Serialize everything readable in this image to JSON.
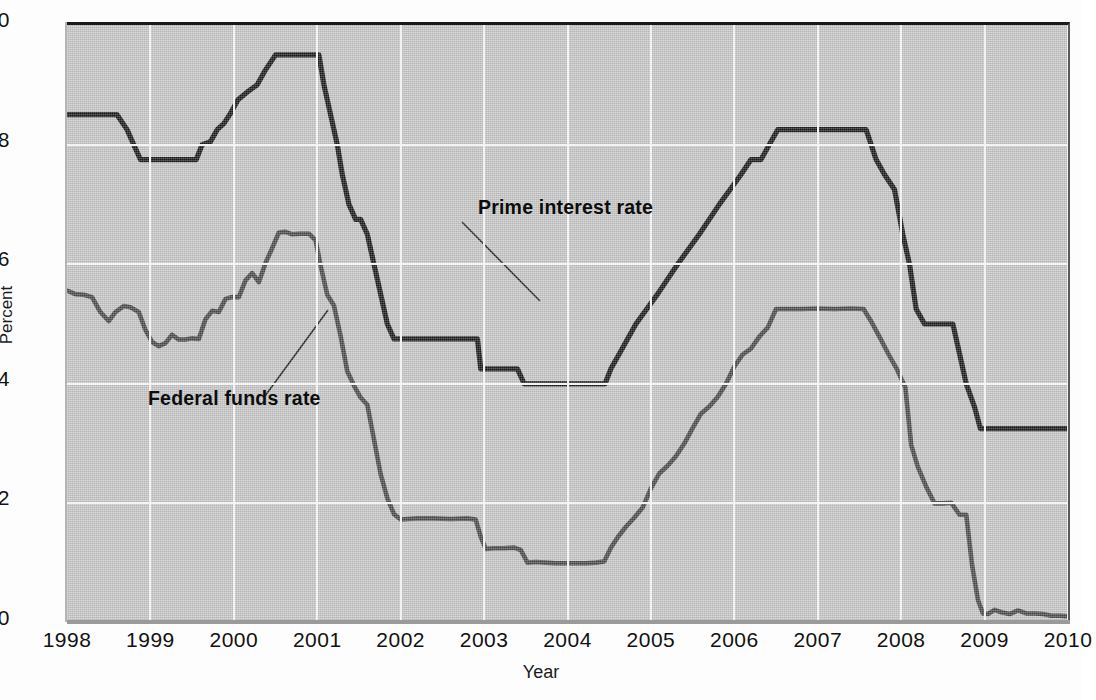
{
  "axes": {
    "y_title": "Percent",
    "x_title": "Year",
    "y_ticks": [
      "10",
      "8",
      "6",
      "4",
      "2",
      "0"
    ],
    "x_ticks": [
      "1998",
      "1999",
      "2000",
      "2001",
      "2002",
      "2003",
      "2004",
      "2005",
      "2006",
      "2007",
      "2008",
      "2009",
      "2010"
    ]
  },
  "annotations": {
    "prime": "Prime interest rate",
    "federal": "Federal funds rate"
  },
  "colors": {
    "plot_background": "#c8c8c8",
    "gridline": "#f3f3f3",
    "prime_line": "#1a1a1a",
    "federal_line": "#4a4a4a",
    "axis_text": "#111111"
  },
  "chart_data": {
    "type": "line",
    "title": "",
    "xlabel": "Year",
    "ylabel": "Percent",
    "xlim": [
      1998,
      2010
    ],
    "ylim": [
      0,
      10
    ],
    "grid": true,
    "legend": "inline-annotations",
    "xticks": [
      1998,
      1999,
      2000,
      2001,
      2002,
      2003,
      2004,
      2005,
      2006,
      2007,
      2008,
      2009,
      2010
    ],
    "yticks": [
      0,
      2,
      4,
      6,
      8,
      10
    ],
    "series": [
      {
        "name": "Prime interest rate",
        "color": "#1a1a1a",
        "points": [
          [
            1998.0,
            8.5
          ],
          [
            1998.6,
            8.5
          ],
          [
            1998.72,
            8.25
          ],
          [
            1998.8,
            8.0
          ],
          [
            1998.88,
            7.75
          ],
          [
            1999.0,
            7.75
          ],
          [
            1999.45,
            7.75
          ],
          [
            1999.55,
            7.75
          ],
          [
            1999.62,
            8.0
          ],
          [
            1999.72,
            8.05
          ],
          [
            1999.8,
            8.25
          ],
          [
            1999.88,
            8.35
          ],
          [
            1999.95,
            8.5
          ],
          [
            2000.05,
            8.75
          ],
          [
            2000.18,
            8.9
          ],
          [
            2000.28,
            9.0
          ],
          [
            2000.38,
            9.25
          ],
          [
            2000.5,
            9.5
          ],
          [
            2000.62,
            9.5
          ],
          [
            2000.95,
            9.5
          ],
          [
            2001.02,
            9.5
          ],
          [
            2001.08,
            9.0
          ],
          [
            2001.16,
            8.5
          ],
          [
            2001.24,
            8.0
          ],
          [
            2001.3,
            7.5
          ],
          [
            2001.38,
            7.0
          ],
          [
            2001.46,
            6.75
          ],
          [
            2001.52,
            6.75
          ],
          [
            2001.6,
            6.5
          ],
          [
            2001.68,
            6.0
          ],
          [
            2001.76,
            5.5
          ],
          [
            2001.84,
            5.0
          ],
          [
            2001.92,
            4.75
          ],
          [
            2002.0,
            4.75
          ],
          [
            2002.6,
            4.75
          ],
          [
            2002.7,
            4.75
          ],
          [
            2002.92,
            4.75
          ],
          [
            2002.96,
            4.25
          ],
          [
            2003.0,
            4.25
          ],
          [
            2003.4,
            4.25
          ],
          [
            2003.48,
            4.0
          ],
          [
            2003.55,
            4.0
          ],
          [
            2004.0,
            4.0
          ],
          [
            2004.45,
            4.0
          ],
          [
            2004.52,
            4.25
          ],
          [
            2004.62,
            4.5
          ],
          [
            2004.72,
            4.75
          ],
          [
            2004.82,
            5.0
          ],
          [
            2004.95,
            5.25
          ],
          [
            2005.08,
            5.5
          ],
          [
            2005.2,
            5.75
          ],
          [
            2005.32,
            6.0
          ],
          [
            2005.45,
            6.25
          ],
          [
            2005.58,
            6.5
          ],
          [
            2005.7,
            6.75
          ],
          [
            2005.82,
            7.0
          ],
          [
            2005.95,
            7.25
          ],
          [
            2006.08,
            7.5
          ],
          [
            2006.2,
            7.75
          ],
          [
            2006.32,
            7.75
          ],
          [
            2006.42,
            8.0
          ],
          [
            2006.52,
            8.25
          ],
          [
            2006.62,
            8.25
          ],
          [
            2007.0,
            8.25
          ],
          [
            2007.45,
            8.25
          ],
          [
            2007.58,
            8.25
          ],
          [
            2007.7,
            7.75
          ],
          [
            2007.8,
            7.5
          ],
          [
            2007.92,
            7.25
          ],
          [
            2008.02,
            6.5
          ],
          [
            2008.1,
            6.0
          ],
          [
            2008.18,
            5.25
          ],
          [
            2008.28,
            5.0
          ],
          [
            2008.38,
            5.0
          ],
          [
            2008.55,
            5.0
          ],
          [
            2008.62,
            5.0
          ],
          [
            2008.7,
            4.5
          ],
          [
            2008.78,
            4.0
          ],
          [
            2008.88,
            3.61
          ],
          [
            2008.95,
            3.25
          ],
          [
            2009.0,
            3.25
          ],
          [
            2009.5,
            3.25
          ],
          [
            2010.0,
            3.25
          ]
        ]
      },
      {
        "name": "Federal funds rate",
        "color": "#4a4a4a",
        "points": [
          [
            1998.0,
            5.56
          ],
          [
            1998.1,
            5.5
          ],
          [
            1998.2,
            5.49
          ],
          [
            1998.3,
            5.45
          ],
          [
            1998.4,
            5.2
          ],
          [
            1998.5,
            5.05
          ],
          [
            1998.58,
            5.2
          ],
          [
            1998.68,
            5.3
          ],
          [
            1998.76,
            5.28
          ],
          [
            1998.86,
            5.2
          ],
          [
            1998.94,
            4.9
          ],
          [
            1999.02,
            4.7
          ],
          [
            1999.1,
            4.63
          ],
          [
            1999.18,
            4.68
          ],
          [
            1999.26,
            4.82
          ],
          [
            1999.34,
            4.74
          ],
          [
            1999.42,
            4.74
          ],
          [
            1999.5,
            4.76
          ],
          [
            1999.58,
            4.75
          ],
          [
            1999.66,
            5.08
          ],
          [
            1999.74,
            5.22
          ],
          [
            1999.82,
            5.2
          ],
          [
            1999.9,
            5.42
          ],
          [
            1999.98,
            5.45
          ],
          [
            2000.06,
            5.45
          ],
          [
            2000.14,
            5.73
          ],
          [
            2000.22,
            5.85
          ],
          [
            2000.3,
            5.7
          ],
          [
            2000.38,
            6.02
          ],
          [
            2000.46,
            6.27
          ],
          [
            2000.54,
            6.53
          ],
          [
            2000.62,
            6.54
          ],
          [
            2000.7,
            6.5
          ],
          [
            2000.8,
            6.51
          ],
          [
            2000.9,
            6.51
          ],
          [
            2000.98,
            6.4
          ],
          [
            2001.04,
            5.98
          ],
          [
            2001.12,
            5.49
          ],
          [
            2001.2,
            5.31
          ],
          [
            2001.28,
            4.8
          ],
          [
            2001.36,
            4.21
          ],
          [
            2001.44,
            3.97
          ],
          [
            2001.52,
            3.77
          ],
          [
            2001.6,
            3.65
          ],
          [
            2001.68,
            3.07
          ],
          [
            2001.76,
            2.49
          ],
          [
            2001.84,
            2.09
          ],
          [
            2001.92,
            1.82
          ],
          [
            2002.0,
            1.73
          ],
          [
            2002.08,
            1.74
          ],
          [
            2002.2,
            1.75
          ],
          [
            2002.4,
            1.75
          ],
          [
            2002.6,
            1.74
          ],
          [
            2002.8,
            1.75
          ],
          [
            2002.9,
            1.73
          ],
          [
            2002.96,
            1.44
          ],
          [
            2003.02,
            1.24
          ],
          [
            2003.12,
            1.25
          ],
          [
            2003.24,
            1.25
          ],
          [
            2003.36,
            1.26
          ],
          [
            2003.44,
            1.22
          ],
          [
            2003.52,
            1.01
          ],
          [
            2003.62,
            1.02
          ],
          [
            2003.74,
            1.01
          ],
          [
            2003.86,
            1.0
          ],
          [
            2003.98,
            1.0
          ],
          [
            2004.1,
            1.0
          ],
          [
            2004.22,
            1.0
          ],
          [
            2004.34,
            1.01
          ],
          [
            2004.44,
            1.03
          ],
          [
            2004.52,
            1.26
          ],
          [
            2004.6,
            1.43
          ],
          [
            2004.7,
            1.61
          ],
          [
            2004.8,
            1.76
          ],
          [
            2004.9,
            1.93
          ],
          [
            2005.0,
            2.25
          ],
          [
            2005.1,
            2.5
          ],
          [
            2005.2,
            2.63
          ],
          [
            2005.3,
            2.79
          ],
          [
            2005.4,
            3.0
          ],
          [
            2005.5,
            3.26
          ],
          [
            2005.6,
            3.5
          ],
          [
            2005.7,
            3.62
          ],
          [
            2005.8,
            3.78
          ],
          [
            2005.9,
            4.0
          ],
          [
            2006.0,
            4.29
          ],
          [
            2006.1,
            4.49
          ],
          [
            2006.2,
            4.59
          ],
          [
            2006.3,
            4.79
          ],
          [
            2006.4,
            4.94
          ],
          [
            2006.5,
            5.25
          ],
          [
            2006.6,
            5.25
          ],
          [
            2006.8,
            5.25
          ],
          [
            2007.0,
            5.26
          ],
          [
            2007.2,
            5.25
          ],
          [
            2007.4,
            5.26
          ],
          [
            2007.55,
            5.25
          ],
          [
            2007.65,
            5.02
          ],
          [
            2007.75,
            4.76
          ],
          [
            2007.85,
            4.49
          ],
          [
            2007.95,
            4.24
          ],
          [
            2008.05,
            3.94
          ],
          [
            2008.12,
            2.98
          ],
          [
            2008.2,
            2.61
          ],
          [
            2008.3,
            2.28
          ],
          [
            2008.4,
            2.0
          ],
          [
            2008.5,
            2.0
          ],
          [
            2008.6,
            2.01
          ],
          [
            2008.7,
            1.81
          ],
          [
            2008.78,
            1.81
          ],
          [
            2008.85,
            0.97
          ],
          [
            2008.92,
            0.39
          ],
          [
            2008.98,
            0.16
          ],
          [
            2009.04,
            0.15
          ],
          [
            2009.12,
            0.22
          ],
          [
            2009.2,
            0.18
          ],
          [
            2009.3,
            0.15
          ],
          [
            2009.4,
            0.21
          ],
          [
            2009.5,
            0.16
          ],
          [
            2009.6,
            0.16
          ],
          [
            2009.7,
            0.15
          ],
          [
            2009.8,
            0.12
          ],
          [
            2009.9,
            0.12
          ],
          [
            2010.0,
            0.11
          ]
        ]
      }
    ]
  }
}
